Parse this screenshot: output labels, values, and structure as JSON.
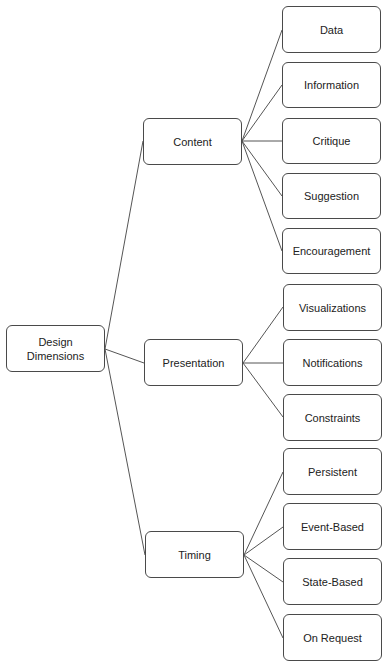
{
  "root": {
    "label": "Design\nDimensions",
    "box": {
      "x": 6,
      "y": 325,
      "w": 99,
      "h": 47
    }
  },
  "categories": [
    {
      "label": "Content",
      "box": {
        "x": 143,
        "y": 118,
        "w": 99,
        "h": 47
      },
      "children": [
        {
          "label": "Data",
          "box": {
            "x": 282,
            "y": 6,
            "w": 99,
            "h": 47
          }
        },
        {
          "label": "Information",
          "box": {
            "x": 282,
            "y": 62,
            "w": 99,
            "h": 46
          }
        },
        {
          "label": "Critique",
          "box": {
            "x": 282,
            "y": 118,
            "w": 99,
            "h": 46
          }
        },
        {
          "label": "Suggestion",
          "box": {
            "x": 282,
            "y": 173,
            "w": 99,
            "h": 46
          }
        },
        {
          "label": "Encouragement",
          "box": {
            "x": 282,
            "y": 228,
            "w": 99,
            "h": 46
          }
        }
      ]
    },
    {
      "label": "Presentation",
      "box": {
        "x": 144,
        "y": 339,
        "w": 99,
        "h": 47
      },
      "children": [
        {
          "label": "Visualizations",
          "box": {
            "x": 283,
            "y": 284,
            "w": 99,
            "h": 47
          }
        },
        {
          "label": "Notifications",
          "box": {
            "x": 283,
            "y": 339,
            "w": 99,
            "h": 47
          }
        },
        {
          "label": "Constraints",
          "box": {
            "x": 283,
            "y": 394,
            "w": 99,
            "h": 47
          }
        }
      ]
    },
    {
      "label": "Timing",
      "box": {
        "x": 145,
        "y": 531,
        "w": 99,
        "h": 47
      },
      "children": [
        {
          "label": "Persistent",
          "box": {
            "x": 283,
            "y": 448,
            "w": 99,
            "h": 47
          }
        },
        {
          "label": "Event-Based",
          "box": {
            "x": 283,
            "y": 503,
            "w": 99,
            "h": 47
          }
        },
        {
          "label": "State-Based",
          "box": {
            "x": 283,
            "y": 558,
            "w": 99,
            "h": 47
          }
        },
        {
          "label": "On Request",
          "box": {
            "x": 283,
            "y": 614,
            "w": 99,
            "h": 47
          }
        }
      ]
    }
  ],
  "connectors": [
    {
      "from": "root",
      "to": "Content",
      "x1": 105,
      "y1": 349,
      "x2": 143,
      "y2": 141
    },
    {
      "from": "root",
      "to": "Presentation",
      "x1": 105,
      "y1": 349,
      "x2": 144,
      "y2": 363
    },
    {
      "from": "root",
      "to": "Timing",
      "x1": 105,
      "y1": 349,
      "x2": 145,
      "y2": 555
    },
    {
      "from": "Content",
      "to": "Data",
      "x1": 242,
      "y1": 141,
      "x2": 282,
      "y2": 30
    },
    {
      "from": "Content",
      "to": "Information",
      "x1": 242,
      "y1": 141,
      "x2": 282,
      "y2": 85
    },
    {
      "from": "Content",
      "to": "Critique",
      "x1": 242,
      "y1": 141,
      "x2": 282,
      "y2": 141
    },
    {
      "from": "Content",
      "to": "Suggestion",
      "x1": 242,
      "y1": 141,
      "x2": 282,
      "y2": 196
    },
    {
      "from": "Content",
      "to": "Encouragement",
      "x1": 242,
      "y1": 141,
      "x2": 282,
      "y2": 251
    },
    {
      "from": "Presentation",
      "to": "Visualizations",
      "x1": 243,
      "y1": 363,
      "x2": 283,
      "y2": 307
    },
    {
      "from": "Presentation",
      "to": "Notifications",
      "x1": 243,
      "y1": 363,
      "x2": 283,
      "y2": 363
    },
    {
      "from": "Presentation",
      "to": "Constraints",
      "x1": 243,
      "y1": 363,
      "x2": 283,
      "y2": 417
    },
    {
      "from": "Timing",
      "to": "Persistent",
      "x1": 244,
      "y1": 555,
      "x2": 283,
      "y2": 472
    },
    {
      "from": "Timing",
      "to": "Event-Based",
      "x1": 244,
      "y1": 555,
      "x2": 283,
      "y2": 527
    },
    {
      "from": "Timing",
      "to": "State-Based",
      "x1": 244,
      "y1": 555,
      "x2": 283,
      "y2": 582
    },
    {
      "from": "Timing",
      "to": "On Request",
      "x1": 244,
      "y1": 555,
      "x2": 283,
      "y2": 638
    }
  ],
  "colors": {
    "border": "#4a4a4a",
    "line": "#555555",
    "text": "#222222",
    "background": "#ffffff"
  }
}
